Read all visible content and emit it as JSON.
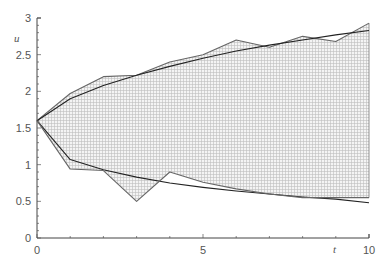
{
  "chart_data": {
    "type": "area",
    "title": "",
    "xlabel": "t",
    "ylabel": "u",
    "xlim": [
      0,
      10
    ],
    "ylim": [
      0,
      3
    ],
    "xticks": [
      0,
      5,
      10
    ],
    "xtick_labels": [
      "0",
      "5",
      "10"
    ],
    "yticks": [
      0,
      0.5,
      1,
      1.5,
      2,
      2.5,
      3
    ],
    "ytick_labels": [
      "0",
      "0.5",
      "1",
      "1.5",
      "2",
      "2.5",
      "3"
    ],
    "grid": false,
    "legend": null,
    "x": [
      0,
      1,
      2,
      3,
      4,
      5,
      6,
      7,
      8,
      9,
      10
    ],
    "series": [
      {
        "name": "upper bound (interval)",
        "values": [
          1.6,
          1.97,
          2.2,
          2.22,
          2.4,
          2.5,
          2.7,
          2.6,
          2.75,
          2.68,
          2.93
        ]
      },
      {
        "name": "upper exact curve",
        "values": [
          1.6,
          1.9,
          2.08,
          2.22,
          2.34,
          2.45,
          2.55,
          2.63,
          2.7,
          2.77,
          2.83
        ]
      },
      {
        "name": "lower exact curve",
        "values": [
          1.6,
          1.07,
          0.93,
          0.83,
          0.75,
          0.69,
          0.64,
          0.6,
          0.56,
          0.53,
          0.48
        ]
      },
      {
        "name": "lower bound (interval)",
        "values": [
          1.6,
          0.94,
          0.92,
          0.5,
          0.9,
          0.76,
          0.67,
          0.6,
          0.55,
          0.55,
          0.55
        ]
      }
    ],
    "fill": "hatched region between upper bound and lower bound"
  },
  "labels": {
    "x": "t",
    "y": "u"
  }
}
